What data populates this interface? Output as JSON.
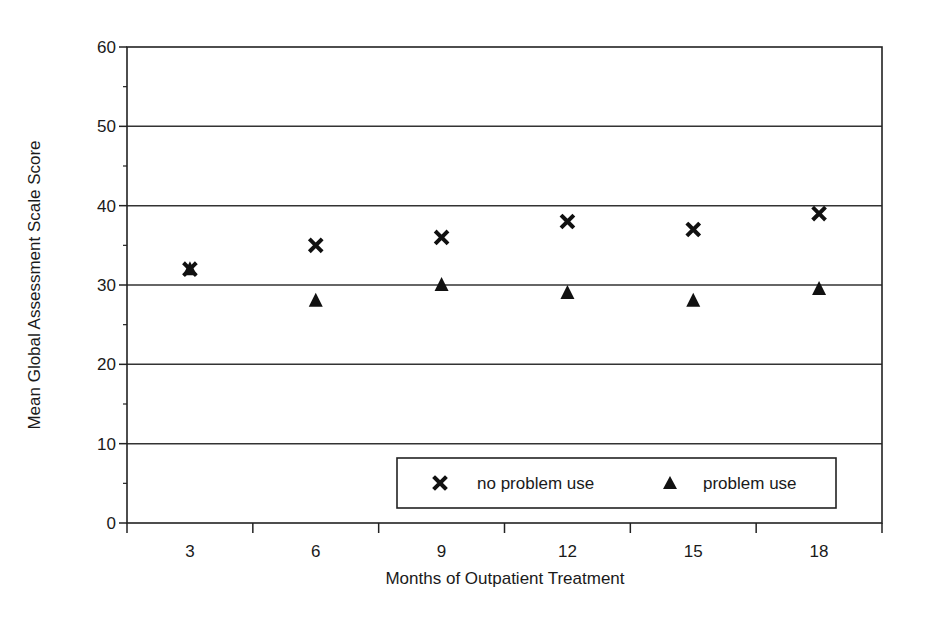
{
  "chart_data": {
    "type": "scatter",
    "title": "",
    "xlabel": "Months of Outpatient Treatment",
    "ylabel": "Mean Global Assessment Scale Score",
    "categories": [
      "3",
      "6",
      "9",
      "12",
      "15",
      "18"
    ],
    "ylim": [
      0,
      60
    ],
    "yticks": [
      "0",
      "10",
      "20",
      "30",
      "40",
      "50",
      "60"
    ],
    "grid": true,
    "legend_position": "lower right (inside plot)",
    "series": [
      {
        "name": "no problem use",
        "marker": "x",
        "values": [
          32,
          35,
          36,
          38,
          37,
          39
        ]
      },
      {
        "name": "problem use",
        "marker": "triangle",
        "values": [
          32,
          28,
          30,
          29,
          28,
          29.5
        ]
      }
    ]
  },
  "legend": {
    "items": [
      {
        "label": "no problem use",
        "marker": "x"
      },
      {
        "label": "problem use",
        "marker": "triangle"
      }
    ]
  },
  "colors": {
    "axis": "#222222",
    "grid": "#333333",
    "marker": "#111111"
  }
}
